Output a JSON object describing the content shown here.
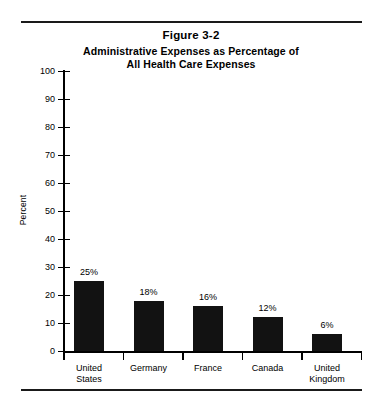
{
  "figure": {
    "number": "Figure 3-2",
    "title_line1": "Administrative Expenses as Percentage of",
    "title_line2": "All Health Care Expenses"
  },
  "chart_data": {
    "type": "bar",
    "title": "Administrative Expenses as Percentage of All Health Care Expenses",
    "figure_number": "Figure 3-2",
    "xlabel": "",
    "ylabel": "Percent",
    "ylim": [
      0,
      100
    ],
    "ytick_step": 10,
    "grid": false,
    "legend": false,
    "bar_color": "#121212",
    "categories": [
      "United States",
      "Germany",
      "France",
      "Canada",
      "United Kingdom"
    ],
    "category_lines": [
      [
        "United",
        "States"
      ],
      [
        "Germany",
        ""
      ],
      [
        "France",
        ""
      ],
      [
        "Canada",
        ""
      ],
      [
        "United",
        "Kingdom"
      ]
    ],
    "values": [
      25,
      18,
      16,
      12,
      6
    ],
    "data_labels": [
      "25%",
      "18%",
      "16%",
      "12%",
      "6%"
    ],
    "ytick_labels": [
      "0",
      "10",
      "20",
      "30",
      "40",
      "50",
      "60",
      "70",
      "80",
      "90",
      "100"
    ]
  }
}
